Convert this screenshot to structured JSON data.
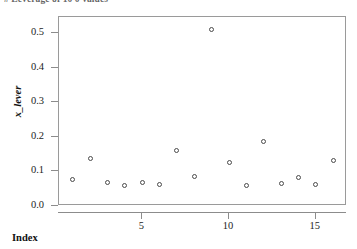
{
  "caption": {
    "text": "# Leverage of 10 0 values"
  },
  "chart_data": {
    "type": "scatter",
    "title": "",
    "xlabel": "Index",
    "ylabel": "x_lever",
    "xlim": [
      0.2,
      16.8
    ],
    "ylim": [
      -0.02,
      0.545
    ],
    "grid": false,
    "legend": null,
    "marker": "open-circle",
    "x": [
      1,
      2,
      3,
      4,
      5,
      6,
      7,
      8,
      9,
      10,
      11,
      12,
      13,
      14,
      15,
      16
    ],
    "y": [
      0.077,
      0.138,
      0.069,
      0.058,
      0.069,
      0.061,
      0.159,
      0.084,
      0.509,
      0.127,
      0.058,
      0.185,
      0.066,
      0.081,
      0.061,
      0.132
    ],
    "xticks": [
      5,
      10,
      15
    ],
    "xticklabels": [
      "5",
      "10",
      "15"
    ],
    "yticks": [
      0.0,
      0.1,
      0.2,
      0.3,
      0.4,
      0.5
    ],
    "yticklabels": [
      "0.0",
      "0.1",
      "0.2",
      "0.3",
      "0.4",
      "0.5"
    ],
    "point_color": "#4a4a4a",
    "frame_color": "#9a9a9a",
    "background": "#ffffff"
  }
}
